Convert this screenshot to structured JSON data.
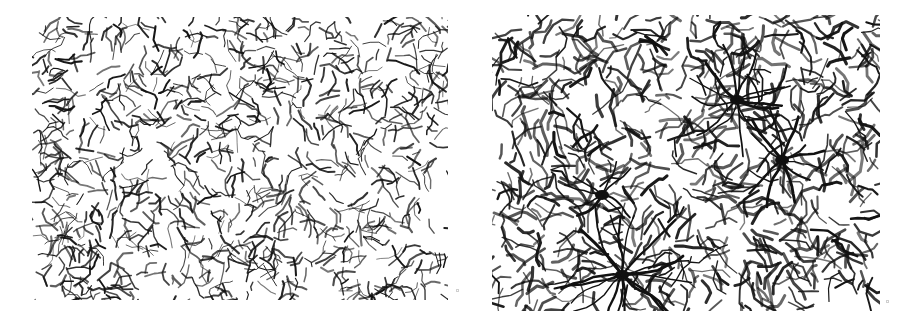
{
  "figure": {
    "background_color": "#ffffff",
    "ink_color": "#111111",
    "panels": [
      {
        "id": "left",
        "box": {
          "x": 32,
          "y": 17,
          "w": 416,
          "h": 283
        },
        "style": "fine, dense, short fragmented segments, evenly distributed",
        "seed": 7,
        "segments": 900,
        "seg_len": [
          3,
          10
        ],
        "stroke": [
          0.8,
          2.2
        ],
        "hubs": []
      },
      {
        "id": "right",
        "box": {
          "x": 492,
          "y": 15,
          "w": 388,
          "h": 296
        },
        "style": "coarser branching network with radiating hub clusters",
        "seed": 13,
        "segments": 700,
        "seg_len": [
          4,
          14
        ],
        "stroke": [
          1.2,
          3.2
        ],
        "hubs": [
          {
            "x": 245,
            "y": 85,
            "r": 45,
            "rays": 14
          },
          {
            "x": 130,
            "y": 260,
            "r": 60,
            "rays": 18
          },
          {
            "x": 290,
            "y": 145,
            "r": 40,
            "rays": 10
          },
          {
            "x": 110,
            "y": 180,
            "r": 30,
            "rays": 8
          }
        ]
      }
    ],
    "corner_markers": [
      {
        "x": 456,
        "y": 289
      },
      {
        "x": 886,
        "y": 300
      }
    ]
  }
}
